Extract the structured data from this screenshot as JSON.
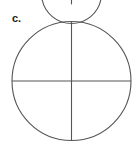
{
  "figure": {
    "label": "c.",
    "caption": "",
    "background_color": "#ffffff",
    "stroke_color": "#555555",
    "label_color": "#1a1a1a",
    "stroke_width": 1.1
  },
  "diagram_data": {
    "type": "geometric-figure",
    "shape": "circle-with-perpendicular-diameters",
    "parts_shown": 4,
    "parts_shaded": 0,
    "fraction_represented": "0/4",
    "circle": {
      "center_x": 71.5,
      "center_y": 81,
      "radius": 59.5,
      "left": 12,
      "right": 131,
      "top": 21.5,
      "bottom": 140.5
    },
    "diameters": [
      {
        "name": "vertical-diameter",
        "x1": 71.5,
        "y1": 21.5,
        "x2": 71.5,
        "y2": 140.5
      },
      {
        "name": "horizontal-diameter",
        "x1": 12,
        "y1": 81,
        "x2": 131,
        "y2": 81
      }
    ],
    "partial_arc_above": {
      "name": "cut-off-arc-fragment",
      "center_x": 71.5,
      "center_y": -26,
      "radius": 30,
      "visible_band_y": [
        0,
        5
      ],
      "tick_x": 71.5,
      "tick_y1": 0,
      "tick_y2": 4.5
    }
  }
}
